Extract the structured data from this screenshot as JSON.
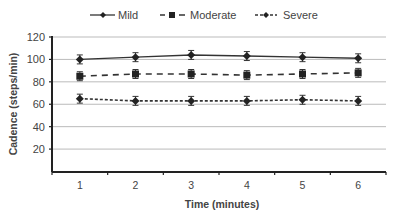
{
  "chart_data": {
    "type": "line",
    "title": "",
    "xlabel": "Time (minutes)",
    "ylabel": "Cadence (steps/min)",
    "categories": [
      "1",
      "2",
      "3",
      "4",
      "5",
      "6"
    ],
    "ylim": [
      0,
      120
    ],
    "yticks": [
      20,
      40,
      60,
      80,
      100,
      120
    ],
    "grid": true,
    "legend_position": "top",
    "error_bars": true,
    "series": [
      {
        "name": "Mild",
        "line_style": "solid",
        "marker": "diamond",
        "values": [
          100,
          102,
          104,
          103,
          102,
          101
        ],
        "error": [
          4,
          4,
          4,
          4,
          4,
          4
        ]
      },
      {
        "name": "Moderate",
        "line_style": "dashed",
        "marker": "square",
        "values": [
          85,
          87,
          87,
          86,
          87,
          88
        ],
        "error": [
          4,
          4,
          4,
          4,
          4,
          4
        ]
      },
      {
        "name": "Severe",
        "line_style": "dotted-dash",
        "marker": "diamond",
        "values": [
          65,
          63,
          63,
          63,
          64,
          63
        ],
        "error": [
          4,
          4,
          4,
          4,
          4,
          4
        ]
      }
    ]
  },
  "legend": {
    "items": [
      {
        "label": "Mild"
      },
      {
        "label": "Moderate"
      },
      {
        "label": "Severe"
      }
    ]
  },
  "axes": {
    "xlabel": "Time (minutes)",
    "ylabel": "Cadence (steps/min)"
  }
}
